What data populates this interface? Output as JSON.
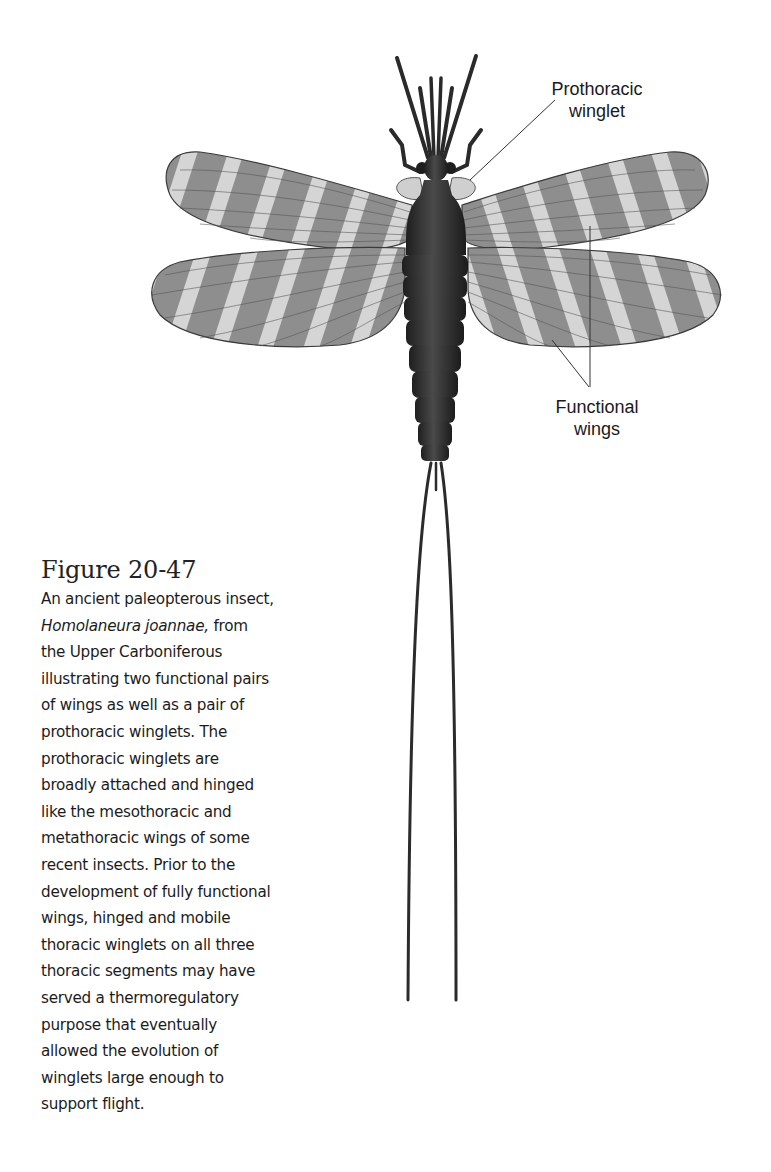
{
  "figure": {
    "title": "Figure 20-47",
    "caption_lines": [
      {
        "text": "An ancient paleopterous insect,"
      },
      {
        "italic": "Homolaneura joannae,",
        "text": " from"
      },
      {
        "text": "the Upper Carboniferous"
      },
      {
        "text": "illustrating two functional pairs"
      },
      {
        "text": "of wings as well as a pair of"
      },
      {
        "text": "prothoracic winglets. The"
      },
      {
        "text": "prothoracic winglets are"
      },
      {
        "text": "broadly attached and hinged"
      },
      {
        "text": "like the mesothoracic and"
      },
      {
        "text": "metathoracic wings of some"
      },
      {
        "text": "recent insects. Prior to the"
      },
      {
        "text": "development of fully functional"
      },
      {
        "text": "wings, hinged and mobile"
      },
      {
        "text": "thoracic winglets on all three"
      },
      {
        "text": "thoracic segments may have"
      },
      {
        "text": "served a thermoregulatory"
      },
      {
        "text": "purpose that eventually"
      },
      {
        "text": "allowed the evolution of"
      },
      {
        "text": "winglets large enough to"
      },
      {
        "text": "support flight."
      }
    ]
  },
  "labels": {
    "prothoracic_winglet": {
      "line1": "Prothoracic",
      "line2": "winglet"
    },
    "functional_wings": {
      "line1": "Functional",
      "line2": "wings"
    }
  },
  "illustration": {
    "subject": "insect-illustration",
    "colors": {
      "body": "#2e2e2e",
      "wing_dark": "#8a8a8a",
      "wing_light": "#d6d6d6",
      "vein": "#4a4a4a",
      "leader_line": "#333333"
    }
  }
}
